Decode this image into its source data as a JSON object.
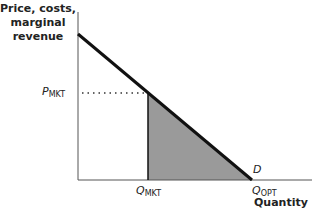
{
  "diagram": {
    "y_axis_label_lines": [
      "Price, costs,",
      "marginal",
      "revenue"
    ],
    "x_axis_label": "Quantity",
    "price_label": {
      "main": "P",
      "sub": "MKT"
    },
    "q_mkt_label": {
      "main": "Q",
      "sub": "MKT"
    },
    "q_opt_label": {
      "main": "Q",
      "sub": "OPT"
    },
    "demand_label": "D",
    "colors": {
      "axis": "#555555",
      "demand": "#111111",
      "shaded": "#9a9a9a",
      "dotted": "#333333"
    }
  }
}
